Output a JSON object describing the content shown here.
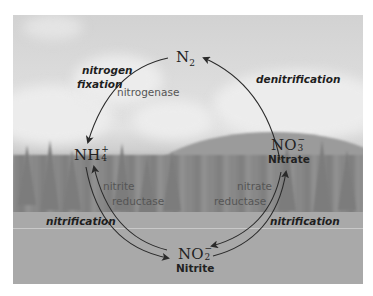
{
  "diagram": {
    "background": "grayscale landscape photo (sky with clouds, mountain, conifer treeline, meadow)",
    "nodes": [
      {
        "id": "n2",
        "formula_main": "N",
        "formula_sub": "2",
        "formula_sup": "",
        "name": ""
      },
      {
        "id": "nh4",
        "formula_main": "NH",
        "formula_sub": "4",
        "formula_sup": "+",
        "name": ""
      },
      {
        "id": "no3",
        "formula_main": "NO",
        "formula_sub": "3",
        "formula_sup": "−",
        "name": "Nitrate"
      },
      {
        "id": "no2",
        "formula_main": "NO",
        "formula_sub": "2",
        "formula_sup": "−",
        "name": "Nitrite"
      }
    ],
    "processes": {
      "fixation_line1": "nitrogen",
      "fixation_line2": "fixation",
      "denitrification": "denitrification",
      "nitrification_left": "nitrification",
      "nitrification_right": "nitrification"
    },
    "enzymes": {
      "nitrogenase": "nitrogenase",
      "nitrite_reductase_line1": "nitrite",
      "nitrite_reductase_line2": "reductase",
      "nitrate_reductase_line1": "nitrate",
      "nitrate_reductase_line2": "reductase"
    },
    "edges": [
      {
        "from": "n2",
        "to": "nh4",
        "process": "nitrogen fixation",
        "enzyme": "nitrogenase"
      },
      {
        "from": "no3",
        "to": "n2",
        "process": "denitrification"
      },
      {
        "from": "nh4",
        "to": "no2",
        "process": "nitrification"
      },
      {
        "from": "no2",
        "to": "nh4",
        "enzyme": "nitrite reductase"
      },
      {
        "from": "no2",
        "to": "no3",
        "process": "nitrification"
      },
      {
        "from": "no3",
        "to": "no2",
        "enzyme": "nitrate reductase"
      }
    ],
    "colors": {
      "arrow": "#2a2a2a",
      "text": "#222222",
      "enzyme_text": "#555555"
    }
  }
}
